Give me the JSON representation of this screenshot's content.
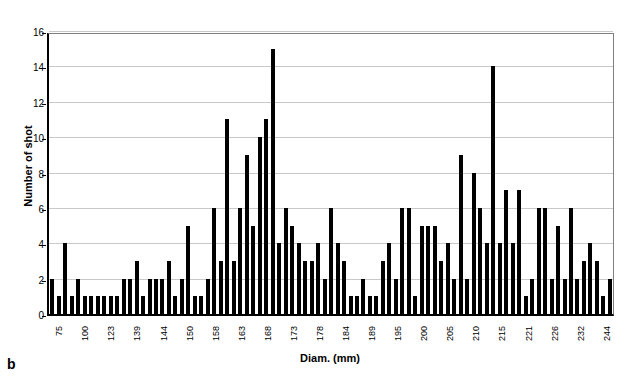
{
  "figure_label": "b",
  "chart_data": {
    "type": "bar",
    "title": "",
    "xlabel": "Diam. (mm)",
    "ylabel": "Number of shot",
    "bar_color": "#000000",
    "gridline_color": "#c9c9c9",
    "grid": "horizontal gridlines at every 2 units",
    "legend": "none",
    "ylim": [
      0,
      16
    ],
    "yticks": [
      0,
      2,
      4,
      6,
      8,
      10,
      12,
      14,
      16
    ],
    "xtick_labels": [
      "75",
      "100",
      "123",
      "139",
      "144",
      "150",
      "158",
      "163",
      "168",
      "173",
      "178",
      "184",
      "189",
      "195",
      "200",
      "205",
      "210",
      "215",
      "221",
      "226",
      "232",
      "244"
    ],
    "xtick_label_interval": 4,
    "values": [
      2,
      1,
      4,
      1,
      2,
      1,
      1,
      1,
      1,
      1,
      1,
      2,
      2,
      3,
      1,
      2,
      2,
      2,
      3,
      1,
      2,
      5,
      1,
      1,
      2,
      6,
      3,
      11,
      3,
      6,
      9,
      5,
      10,
      11,
      15,
      4,
      6,
      5,
      4,
      3,
      3,
      4,
      2,
      6,
      4,
      3,
      1,
      1,
      2,
      1,
      1,
      3,
      4,
      2,
      6,
      6,
      1,
      5,
      5,
      5,
      3,
      4,
      2,
      9,
      2,
      8,
      6,
      4,
      14,
      4,
      7,
      4,
      7,
      1,
      2,
      6,
      6,
      2,
      5,
      2,
      6,
      2,
      3,
      4,
      3,
      1,
      2
    ]
  }
}
